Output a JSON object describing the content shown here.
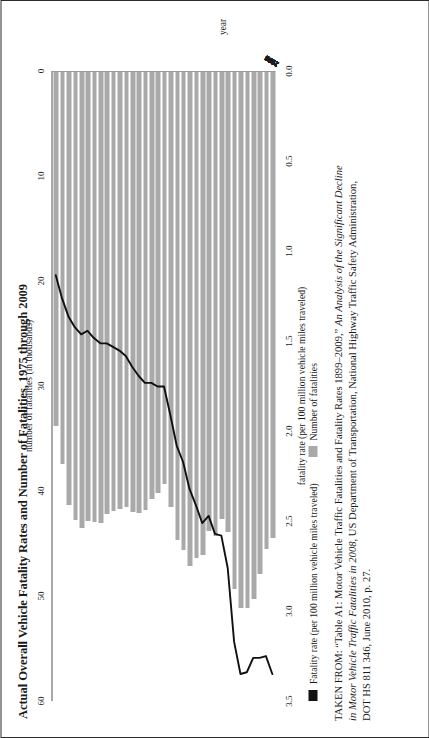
{
  "document": {
    "title": "Actual Overall Vehicle Fatality Rates and Number of Fatalities, 1975 through 2009",
    "source_note_line1": "TAKEN FROM: “Table A1: Motor Vehicle Traffic Fatalities and Fatality Rates 1899–2009,” An Analysis of the Significant Decline",
    "source_note_line2": "in Motor Vehicle Traffic Fatalities in 2008, US Department of Transportation, National Highway Traffic Safety Administration,",
    "source_note_line3": "DOT HS 811 346, June 2010, p. 27."
  },
  "legend": {
    "items": [
      {
        "label": "Fatality rate (per 100 million vehicle miles traveled)",
        "swatch": "line-swatch",
        "color": "#111111"
      },
      {
        "label": "Number of fatalities",
        "swatch": "bar-swatch",
        "color": "#a9a9a9"
      }
    ]
  },
  "chart_data": {
    "type": "bar",
    "title": "Actual Overall Vehicle Fatality Rates and Number of Fatalities, 1975 through 2009",
    "orientation": "horizontal",
    "xlabel": "year",
    "grid": false,
    "legend_position": "below",
    "axes": {
      "category_axis": {
        "label": "year",
        "ticks": [
          "1975",
          "1976",
          "1977",
          "1978",
          "1979",
          "1980",
          "1981",
          "1982",
          "1983",
          "1984",
          "1985",
          "1986",
          "1987",
          "1988",
          "1989",
          "1990",
          "1991",
          "1992",
          "1993",
          "1994",
          "1995",
          "1996",
          "1997",
          "1998",
          "1999",
          "2000",
          "2001",
          "2002",
          "2003",
          "2004",
          "2005",
          "2006",
          "2007",
          "2008",
          "2009"
        ]
      },
      "fatalities_axis": {
        "label": "number of fatalities (in thousands)",
        "ticks": [
          0,
          10,
          20,
          30,
          40,
          50,
          60
        ],
        "lim": [
          0,
          60
        ],
        "position": "top"
      },
      "rate_axis": {
        "label": "fatality rate (per 100 million vehicle miles traveled)",
        "ticks": [
          "0.0",
          "0.5",
          "1.0",
          "1.5",
          "2.0",
          "2.5",
          "3.0",
          "3.5"
        ],
        "lim": [
          0,
          3.5
        ],
        "position": "bottom"
      }
    },
    "categories": [
      "1975",
      "1976",
      "1977",
      "1978",
      "1979",
      "1980",
      "1981",
      "1982",
      "1983",
      "1984",
      "1985",
      "1986",
      "1987",
      "1988",
      "1989",
      "1990",
      "1991",
      "1992",
      "1993",
      "1994",
      "1995",
      "1996",
      "1997",
      "1998",
      "1999",
      "2000",
      "2001",
      "2002",
      "2003",
      "2004",
      "2005",
      "2006",
      "2007",
      "2008",
      "2009"
    ],
    "series": [
      {
        "name": "Number of fatalities",
        "unit": "thousands",
        "type": "bar",
        "color": "#a9a9a9",
        "values": [
          44.5,
          45.5,
          47.9,
          50.3,
          51.1,
          51.1,
          49.3,
          43.9,
          42.6,
          44.3,
          43.8,
          46.1,
          46.4,
          47.1,
          45.6,
          44.6,
          41.5,
          39.3,
          40.2,
          40.7,
          41.8,
          42.1,
          42.0,
          41.5,
          41.7,
          41.9,
          42.2,
          43.0,
          42.9,
          42.8,
          43.5,
          42.7,
          41.3,
          37.4,
          33.8
        ]
      },
      {
        "name": "Fatality rate (per 100 million vehicle miles traveled)",
        "unit": "per 100 million VMT",
        "type": "line",
        "color": "#111111",
        "values": [
          3.35,
          3.25,
          3.26,
          3.26,
          3.34,
          3.35,
          3.17,
          2.76,
          2.58,
          2.57,
          2.47,
          2.51,
          2.41,
          2.32,
          2.17,
          2.08,
          1.91,
          1.75,
          1.75,
          1.73,
          1.73,
          1.69,
          1.64,
          1.58,
          1.55,
          1.53,
          1.51,
          1.51,
          1.48,
          1.44,
          1.46,
          1.42,
          1.36,
          1.26,
          1.13
        ]
      }
    ]
  }
}
